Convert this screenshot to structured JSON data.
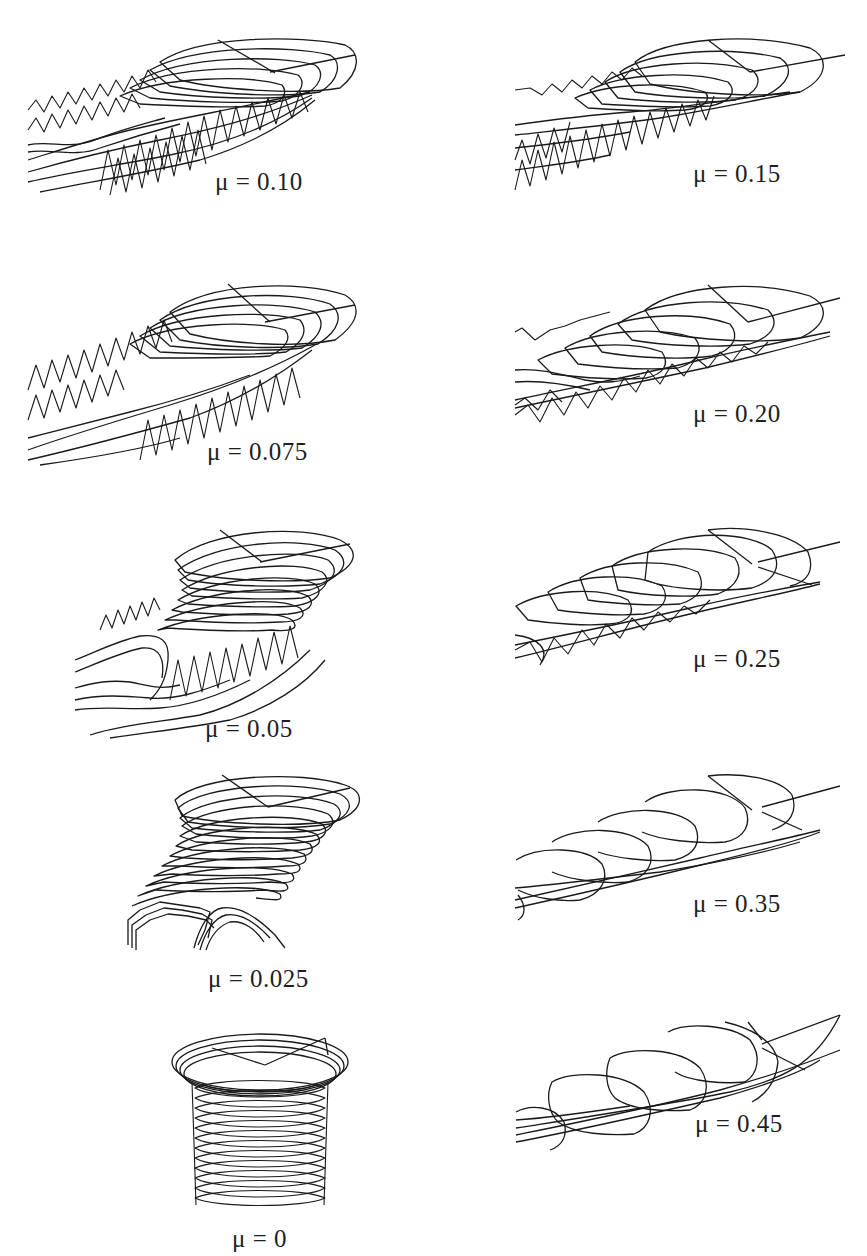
{
  "figure": {
    "panels": [
      {
        "id": "mu-0.10",
        "column": "left",
        "row": 1,
        "label": "μ = 0.10",
        "mu": 0.1
      },
      {
        "id": "mu-0.15",
        "column": "right",
        "row": 1,
        "label": "μ = 0.15",
        "mu": 0.15
      },
      {
        "id": "mu-0.075",
        "column": "left",
        "row": 2,
        "label": "μ = 0.075",
        "mu": 0.075
      },
      {
        "id": "mu-0.20",
        "column": "right",
        "row": 2,
        "label": "μ = 0.20",
        "mu": 0.2
      },
      {
        "id": "mu-0.05",
        "column": "left",
        "row": 3,
        "label": "μ = 0.05",
        "mu": 0.05
      },
      {
        "id": "mu-0.25",
        "column": "right",
        "row": 3,
        "label": "μ = 0.25",
        "mu": 0.25
      },
      {
        "id": "mu-0.025",
        "column": "left",
        "row": 4,
        "label": "μ = 0.025",
        "mu": 0.025
      },
      {
        "id": "mu-0.35",
        "column": "right",
        "row": 4,
        "label": "μ = 0.35",
        "mu": 0.35
      },
      {
        "id": "mu-0",
        "column": "left",
        "row": 5,
        "label": "μ = 0",
        "mu": 0
      },
      {
        "id": "mu-0.45",
        "column": "right",
        "row": 5,
        "label": "μ = 0.45",
        "mu": 0.45
      }
    ],
    "line_color": "#1a1a1a",
    "background": "#ffffff"
  }
}
